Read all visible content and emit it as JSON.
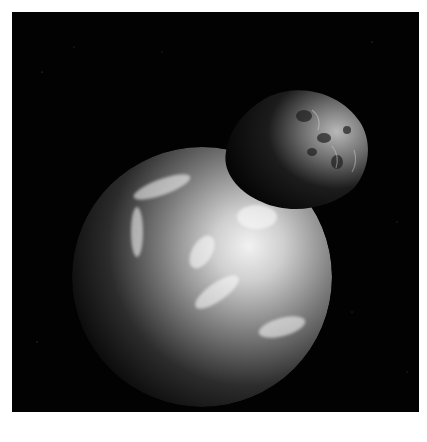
{
  "image": {
    "description": "Grayscale render of Earth partially eclipsed by a cratered asteroid in the foreground against black starry space",
    "subjects": [
      {
        "name": "earth",
        "label": "Earth",
        "tone": "lit from upper right, clouds visible, dark limb on left"
      },
      {
        "name": "asteroid",
        "label": "Asteroid",
        "tone": "irregular cratered rock, lit on right edge"
      }
    ],
    "colors": {
      "background": "#020202",
      "border": "#ffffff",
      "earth_highlight": "#e8e8e8",
      "earth_mid": "#7a7a7a",
      "asteroid_lit": "#a8a8a8",
      "asteroid_shadow": "#0c0c0c"
    }
  }
}
